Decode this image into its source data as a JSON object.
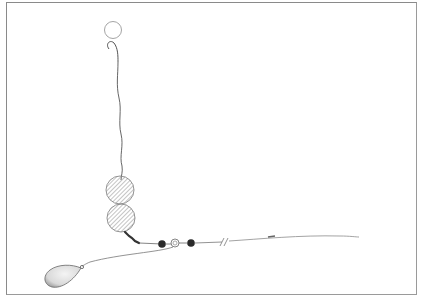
{
  "diagram": {
    "type": "fishing-rig-illustration",
    "labels": [],
    "components": [
      {
        "name": "hook-bait",
        "shape": "circle"
      },
      {
        "name": "hook",
        "shape": "curve"
      },
      {
        "name": "hooklink",
        "shape": "wavy-line"
      },
      {
        "name": "pop-up-bait-upper",
        "shape": "hatched-circle"
      },
      {
        "name": "pop-up-bait-lower",
        "shape": "hatched-circle"
      },
      {
        "name": "swivel",
        "shape": "link"
      },
      {
        "name": "bead-left",
        "shape": "dark-bead"
      },
      {
        "name": "ring-swivel",
        "shape": "ring"
      },
      {
        "name": "bead-right",
        "shape": "dark-bead"
      },
      {
        "name": "mainline-break",
        "shape": "double-slash"
      },
      {
        "name": "mainline",
        "shape": "line"
      },
      {
        "name": "lead-link",
        "shape": "line"
      },
      {
        "name": "lead-weight",
        "shape": "pear"
      }
    ],
    "colors": {
      "line": "#555555",
      "bead": "#2a2a2a",
      "hatch": "#777777",
      "frame": "#8a8a8a"
    }
  }
}
